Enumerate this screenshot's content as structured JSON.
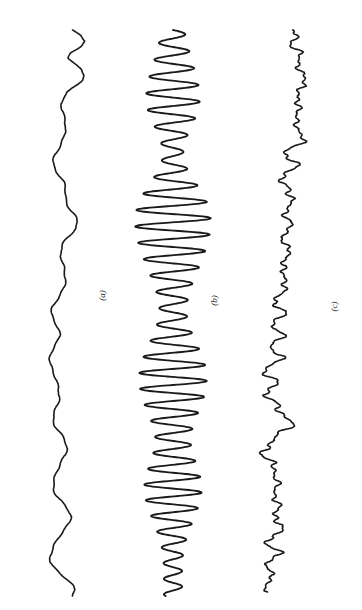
{
  "figure": {
    "background_color": "#ffffff",
    "width": 362,
    "height": 610,
    "orientation": "traces rotated 90 degrees; time axis runs vertically downward",
    "line_color": "#1a1a1a",
    "line_width": 1.6
  },
  "panels": [
    {
      "label": "(a)",
      "label_x": 105,
      "label_y": 297,
      "baseline_x": 64,
      "trace_top_y": 30,
      "trace_bottom_y": 596,
      "description": "smooth low-frequency wandering trace (red noise / random walk)"
    },
    {
      "label": "(b)",
      "label_x": 217,
      "label_y": 302,
      "baseline_x": 173,
      "trace_top_y": 30,
      "trace_bottom_y": 596,
      "description": "high-frequency oscillation with amplitude envelope peaking near the middle"
    },
    {
      "label": "(c)",
      "label_x": 337,
      "label_y": 308,
      "baseline_x": 283,
      "trace_top_y": 30,
      "trace_bottom_y": 592,
      "description": "broadband noisy trace mixing low and medium frequency content"
    }
  ],
  "chart_data": {
    "type": "line",
    "title": "",
    "subtitle": "",
    "xlabel": "",
    "ylabel": "",
    "grid": false,
    "legend": "none",
    "axes_visible": false,
    "tick_labels": [],
    "annotations": [
      "(a)",
      "(b)",
      "(c)"
    ],
    "x": [
      0,
      1,
      2,
      3,
      4,
      5,
      6,
      7,
      8,
      9,
      10,
      11,
      12,
      13,
      14,
      15,
      16,
      17,
      18,
      19,
      20,
      21,
      22,
      23,
      24,
      25,
      26,
      27,
      28,
      29,
      30,
      31,
      32,
      33,
      34,
      35,
      36,
      37,
      38,
      39,
      40,
      41,
      42,
      43,
      44,
      45,
      46,
      47,
      48,
      49,
      50,
      51,
      52,
      53,
      54,
      55,
      56,
      57,
      58,
      59,
      60,
      61,
      62,
      63,
      64,
      65,
      66,
      67,
      68,
      69,
      70,
      71,
      72,
      73,
      74,
      75,
      76,
      77,
      78,
      79,
      80,
      81,
      82,
      83,
      84,
      85,
      86,
      87,
      88,
      89,
      90,
      91,
      92,
      93,
      94,
      95,
      96,
      97,
      98,
      99,
      100
    ],
    "xlim": [
      0,
      100
    ],
    "ylim": [
      -1,
      1
    ],
    "series": [
      {
        "name": "(a)",
        "kind": "smooth low-frequency noise",
        "amplitude_scale": 26,
        "values": [
          0.3,
          0.62,
          0.78,
          0.6,
          0.3,
          0.22,
          0.42,
          0.66,
          0.74,
          0.64,
          0.42,
          0.18,
          0.0,
          -0.1,
          -0.12,
          -0.06,
          0.04,
          0.1,
          0.08,
          0.0,
          -0.12,
          -0.26,
          -0.36,
          -0.4,
          -0.36,
          -0.26,
          -0.14,
          -0.04,
          0.02,
          0.06,
          0.1,
          0.18,
          0.3,
          0.42,
          0.48,
          0.44,
          0.3,
          0.12,
          -0.04,
          -0.14,
          -0.16,
          -0.1,
          0.0,
          0.08,
          0.1,
          0.04,
          -0.08,
          -0.22,
          -0.34,
          -0.42,
          -0.44,
          -0.4,
          -0.32,
          -0.24,
          -0.2,
          -0.24,
          -0.34,
          -0.46,
          -0.54,
          -0.56,
          -0.5,
          -0.38,
          -0.26,
          -0.18,
          -0.16,
          -0.2,
          -0.28,
          -0.36,
          -0.4,
          -0.38,
          -0.3,
          -0.18,
          -0.06,
          0.04,
          0.1,
          0.08,
          -0.02,
          -0.16,
          -0.3,
          -0.4,
          -0.44,
          -0.4,
          -0.28,
          -0.12,
          0.04,
          0.16,
          0.22,
          0.2,
          0.1,
          -0.06,
          -0.24,
          -0.4,
          -0.52,
          -0.56,
          -0.5,
          -0.34,
          -0.12,
          0.1,
          0.28,
          0.38,
          0.34
        ]
      },
      {
        "name": "(b)",
        "kind": "amplitude-modulated oscillation",
        "amplitude_scale": 38,
        "carrier_cycles": 34,
        "envelope": [
          0.3,
          0.33,
          0.36,
          0.4,
          0.44,
          0.48,
          0.52,
          0.57,
          0.61,
          0.65,
          0.68,
          0.7,
          0.71,
          0.7,
          0.67,
          0.62,
          0.56,
          0.49,
          0.42,
          0.36,
          0.31,
          0.28,
          0.27,
          0.29,
          0.34,
          0.41,
          0.5,
          0.6,
          0.7,
          0.79,
          0.87,
          0.93,
          0.97,
          0.99,
          1.0,
          0.99,
          0.97,
          0.94,
          0.9,
          0.85,
          0.8,
          0.74,
          0.68,
          0.62,
          0.56,
          0.5,
          0.45,
          0.41,
          0.38,
          0.36,
          0.36,
          0.38,
          0.42,
          0.47,
          0.53,
          0.6,
          0.67,
          0.73,
          0.79,
          0.84,
          0.87,
          0.89,
          0.89,
          0.88,
          0.85,
          0.81,
          0.76,
          0.7,
          0.64,
          0.58,
          0.53,
          0.49,
          0.47,
          0.47,
          0.49,
          0.53,
          0.58,
          0.63,
          0.68,
          0.72,
          0.75,
          0.76,
          0.75,
          0.72,
          0.68,
          0.63,
          0.57,
          0.51,
          0.45,
          0.4,
          0.35,
          0.31,
          0.28,
          0.26,
          0.25,
          0.24,
          0.24,
          0.24,
          0.24,
          0.24,
          0.24
        ]
      },
      {
        "name": "(c)",
        "kind": "broadband noise",
        "amplitude_scale": 30,
        "values": [
          0.18,
          0.46,
          0.3,
          0.44,
          0.52,
          0.46,
          0.56,
          0.64,
          0.58,
          0.68,
          0.74,
          0.6,
          0.34,
          0.46,
          0.66,
          0.52,
          0.3,
          0.44,
          0.62,
          0.7,
          0.54,
          0.28,
          0.1,
          0.24,
          0.42,
          0.3,
          0.08,
          -0.1,
          0.06,
          0.26,
          0.4,
          0.22,
          0.0,
          0.14,
          0.32,
          0.2,
          -0.02,
          0.1,
          0.06,
          0.16,
          0.1,
          0.18,
          0.04,
          -0.12,
          0.02,
          0.2,
          0.06,
          -0.16,
          -0.3,
          -0.14,
          0.04,
          -0.12,
          -0.34,
          -0.2,
          -0.02,
          -0.18,
          -0.38,
          -0.26,
          -0.08,
          -0.24,
          -0.44,
          -0.6,
          -0.42,
          -0.22,
          -0.38,
          -0.56,
          -0.4,
          -0.18,
          -0.02,
          0.14,
          0.28,
          0.12,
          -0.1,
          -0.34,
          -0.56,
          -0.7,
          -0.52,
          -0.3,
          -0.44,
          -0.26,
          -0.08,
          -0.22,
          -0.4,
          -0.24,
          -0.06,
          -0.2,
          -0.36,
          -0.18,
          0.02,
          -0.14,
          -0.32,
          -0.5,
          -0.34,
          -0.16,
          -0.34,
          -0.52,
          -0.36,
          -0.54,
          -0.38,
          -0.56,
          -0.44
        ]
      }
    ]
  }
}
